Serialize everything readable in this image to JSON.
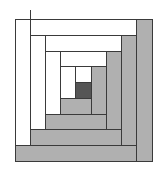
{
  "diagram": {
    "type": "log-cabin-quilt-block",
    "width": 162,
    "height": 169,
    "colors": {
      "light": "#ffffff",
      "dark": "#b0b0b0",
      "center": "#555555",
      "stroke": "#3a3a3a",
      "background": "#ffffff"
    },
    "center": {
      "name": "center-square",
      "x": 75,
      "y": 82,
      "w": 16,
      "h": 16,
      "fill": "center"
    },
    "rings": [
      {
        "ring": 1,
        "pieces": [
          {
            "name": "ring-1-top",
            "x": 75,
            "y": 66,
            "w": 16,
            "h": 16,
            "fill": "light"
          },
          {
            "name": "ring-1-left",
            "x": 60,
            "y": 66,
            "w": 15,
            "h": 32,
            "fill": "light"
          },
          {
            "name": "ring-1-bottom",
            "x": 60,
            "y": 98,
            "w": 31,
            "h": 16,
            "fill": "dark"
          },
          {
            "name": "ring-1-right",
            "x": 91,
            "y": 66,
            "w": 15,
            "h": 48,
            "fill": "dark"
          }
        ]
      },
      {
        "ring": 2,
        "pieces": [
          {
            "name": "ring-2-top",
            "x": 60,
            "y": 51,
            "w": 46,
            "h": 15,
            "fill": "light"
          },
          {
            "name": "ring-2-left",
            "x": 45,
            "y": 51,
            "w": 15,
            "h": 63,
            "fill": "light"
          },
          {
            "name": "ring-2-bottom",
            "x": 45,
            "y": 114,
            "w": 61,
            "h": 15,
            "fill": "dark"
          },
          {
            "name": "ring-2-right",
            "x": 106,
            "y": 51,
            "w": 15,
            "h": 78,
            "fill": "dark"
          }
        ]
      },
      {
        "ring": 3,
        "pieces": [
          {
            "name": "ring-3-top",
            "x": 45,
            "y": 35,
            "w": 76,
            "h": 16,
            "fill": "light"
          },
          {
            "name": "ring-3-left",
            "x": 30,
            "y": 35,
            "w": 15,
            "h": 94,
            "fill": "light"
          },
          {
            "name": "ring-3-bottom",
            "x": 30,
            "y": 129,
            "w": 91,
            "h": 16,
            "fill": "dark"
          },
          {
            "name": "ring-3-right",
            "x": 121,
            "y": 35,
            "w": 15,
            "h": 110,
            "fill": "dark"
          }
        ]
      },
      {
        "ring": 4,
        "pieces": [
          {
            "name": "ring-4-top",
            "x": 30,
            "y": 19,
            "w": 106,
            "h": 16,
            "fill": "light"
          },
          {
            "name": "ring-4-left",
            "x": 15,
            "y": 19,
            "w": 15,
            "h": 126,
            "fill": "light"
          },
          {
            "name": "ring-4-bottom",
            "x": 15,
            "y": 145,
            "w": 121,
            "h": 16,
            "fill": "dark"
          },
          {
            "name": "ring-4-right",
            "x": 136,
            "y": 19,
            "w": 16,
            "h": 142,
            "fill": "dark"
          }
        ]
      }
    ],
    "overshoot_tick": {
      "x": 30,
      "y1": 10,
      "y2": 19
    }
  }
}
